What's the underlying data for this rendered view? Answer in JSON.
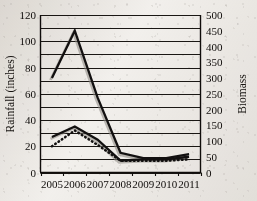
{
  "chart_data": {
    "type": "line",
    "title": "",
    "xlabel": "",
    "ylabel": "Rainfall (inches)",
    "y2label": "Biomass",
    "categories": [
      "2005",
      "2006",
      "2007",
      "2008",
      "2009",
      "2010",
      "2011"
    ],
    "ylim": [
      0,
      120
    ],
    "y2lim": [
      0,
      500
    ],
    "yticks": [
      "0",
      "20",
      "40",
      "60",
      "80",
      "100",
      "120"
    ],
    "y2ticks": [
      "0",
      "50",
      "100",
      "150",
      "200",
      "250",
      "300",
      "350",
      "400",
      "450",
      "500"
    ],
    "ytick_values": [
      0,
      20,
      40,
      60,
      80,
      100,
      120
    ],
    "y2tick_values": [
      0,
      50,
      100,
      150,
      200,
      250,
      300,
      350,
      400,
      450,
      500
    ],
    "gridline_values": [
      0,
      10,
      20,
      30,
      40,
      50,
      60,
      70,
      80,
      90,
      100,
      110,
      120
    ],
    "grid": "horizontal",
    "legend": "none",
    "series": [
      {
        "name": "rainfall-peak-series",
        "axis": "left",
        "style": "solid",
        "values": [
          72,
          108,
          57,
          15,
          11,
          11,
          14
        ]
      },
      {
        "name": "biomass-solid-series",
        "axis": "left",
        "style": "solid",
        "values": [
          27,
          35,
          25,
          9,
          10,
          10,
          12
        ]
      },
      {
        "name": "biomass-dotted-series",
        "axis": "left",
        "style": "dotted",
        "values": [
          20,
          32,
          21,
          9,
          9,
          9,
          10
        ]
      }
    ]
  },
  "axes": {
    "left_title": "Rainfall (inches)",
    "right_title": "Biomass"
  }
}
